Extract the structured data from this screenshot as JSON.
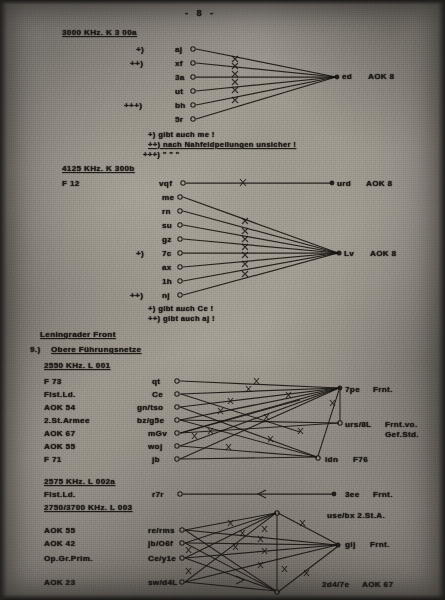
{
  "document": {
    "page_number_label": "-  8  -",
    "type": "scanned-typewritten-document"
  },
  "sections": [
    {
      "id": "k300a",
      "heading": "3000 KHz.    K 3 00a",
      "left_column": [],
      "nodes": [
        {
          "marker": "+)",
          "call": "aj"
        },
        {
          "marker": "++)",
          "call": "xf"
        },
        {
          "marker": "",
          "call": "3a"
        },
        {
          "marker": "",
          "call": "ut"
        },
        {
          "marker": "+++)",
          "call": "bh"
        },
        {
          "marker": "",
          "call": "5r"
        }
      ],
      "hub": {
        "call": "ed",
        "unit": "AOK 8"
      },
      "footnotes": [
        "+)  gibt auch me !",
        "++)  nach Nahfeldpeilungen unsicher !",
        "+++)      \"                    \"                    \""
      ]
    },
    {
      "id": "k300b",
      "heading": "4125 KHz.   K 300b",
      "left_label": "F 12",
      "top_node": {
        "marker": "",
        "call": "vqf"
      },
      "top_hub": {
        "call": "urd",
        "unit": "AOK 8"
      },
      "nodes": [
        {
          "marker": "",
          "call": "me"
        },
        {
          "marker": "",
          "call": "rn"
        },
        {
          "marker": "",
          "call": "su"
        },
        {
          "marker": "",
          "call": "gz"
        },
        {
          "marker": "+)",
          "call": "7c"
        },
        {
          "marker": "",
          "call": "ax"
        },
        {
          "marker": "",
          "call": "1h"
        },
        {
          "marker": "++)",
          "call": "nj"
        }
      ],
      "hub": {
        "call": "Lv",
        "unit": "AOK 8"
      },
      "footnotes": [
        "+)  gibt auch Ce !",
        "++)  gibt auch aj !"
      ]
    },
    {
      "id": "leningrad",
      "front_heading": "Leningrader Front",
      "item_number": "9.)",
      "item_heading": "Obere Führungsnetze",
      "subsections": [
        {
          "id": "l001",
          "heading": "2550 KHz.    L 001",
          "rows": [
            {
              "unit": "F 73",
              "call": "qt"
            },
            {
              "unit": "Flst.Ld.",
              "call": "Ce"
            },
            {
              "unit": "AOK 54",
              "call": "gn/tso"
            },
            {
              "unit": "2.St.Armee",
              "call": "bz/g5e"
            },
            {
              "unit": "AOK 67",
              "call": "mGv"
            },
            {
              "unit": "AOK 55",
              "call": "woj"
            },
            {
              "unit": "F 71",
              "call": "jb"
            }
          ],
          "right_labels": [
            {
              "call": "7pe",
              "unit": "Frnt."
            },
            {
              "call": "urs/8L",
              "unit": "Frnt.vo."
            },
            {
              "call": "",
              "unit": "Gef.Std."
            },
            {
              "call": "idn",
              "unit": "F76"
            }
          ]
        },
        {
          "id": "l002a",
          "heading": "2575 KHz.   L 002a",
          "rows": [
            {
              "unit": "Flst.Ld.",
              "call": "r7r"
            }
          ],
          "right_labels": [
            {
              "call": "3ee",
              "unit": "Frnt."
            }
          ]
        },
        {
          "id": "l003",
          "heading": "2750/3700 KHz.  L 003",
          "note_right": "use/bx   2.St.A.",
          "rows": [
            {
              "unit": "AOK 55",
              "call": "re/rms"
            },
            {
              "unit": "AOK 42",
              "call": "jb/O6f"
            },
            {
              "unit": "Op.Gr.Prim.",
              "call": "Ce/y1e"
            },
            {
              "unit": "AOK 23",
              "call": "sw/d4L"
            }
          ],
          "right_labels": [
            {
              "call": "gij",
              "unit": "Frnt."
            },
            {
              "call": "2d4/7e",
              "unit": "AOK 67"
            }
          ]
        }
      ]
    }
  ]
}
